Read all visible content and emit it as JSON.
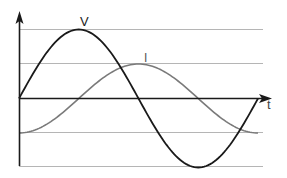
{
  "diagram": {
    "title": "",
    "labels": {
      "voltage": "V",
      "current": "I",
      "time_axis": "t"
    },
    "colors": {
      "voltage_curve": "#1a1a1a",
      "current_curve": "#7a7a7a",
      "gridlines": "#b5b5b5",
      "axes": "#1a1a1a",
      "background": "#ffffff"
    },
    "curves": [
      {
        "name": "V",
        "type": "sine",
        "amplitude": 1.0,
        "phase_deg": 0,
        "cycles": 1
      },
      {
        "name": "I",
        "type": "sine",
        "amplitude": 0.5,
        "phase_deg": -90,
        "cycles": 1
      }
    ],
    "gridlines_y": [
      1.0,
      0.5,
      -0.5,
      -1.0
    ]
  }
}
